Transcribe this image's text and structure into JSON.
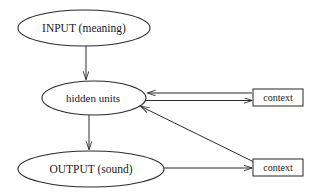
{
  "diagram": {
    "background_color": "#ffffff",
    "line_color": "#2b2b2b",
    "text_color": "#1a1a1a",
    "nodes": [
      {
        "id": "input",
        "label": "INPUT (meaning)",
        "shape": "ellipse",
        "cx": 84,
        "cy": 28,
        "rx": 66,
        "ry": 18
      },
      {
        "id": "hidden",
        "label": "hidden units",
        "shape": "ellipse",
        "cx": 94,
        "cy": 98,
        "rx": 52,
        "ry": 17
      },
      {
        "id": "output",
        "label": "OUTPUT (sound)",
        "shape": "ellipse",
        "cx": 91,
        "cy": 169,
        "rx": 73,
        "ry": 18
      },
      {
        "id": "context-upper",
        "label": "context",
        "shape": "rect",
        "x": 253,
        "y": 89,
        "width": 50,
        "height": 17
      },
      {
        "id": "context-lower",
        "label": "context",
        "shape": "rect",
        "x": 253,
        "y": 159,
        "width": 50,
        "height": 17
      }
    ],
    "edges": [
      {
        "id": "input-to-hidden",
        "from": "input",
        "to": "hidden",
        "direction": "down",
        "arrow": "end"
      },
      {
        "id": "hidden-to-output",
        "from": "hidden",
        "to": "output",
        "direction": "down",
        "arrow": "end"
      },
      {
        "id": "context-upper-to-hidden",
        "from": "context-upper",
        "to": "hidden",
        "direction": "left",
        "arrow": "end"
      },
      {
        "id": "hidden-to-context-upper",
        "from": "hidden",
        "to": "context-upper",
        "direction": "right",
        "arrow": "end"
      },
      {
        "id": "output-to-context-lower",
        "from": "output",
        "to": "context-lower",
        "direction": "right",
        "arrow": "end"
      },
      {
        "id": "context-lower-to-hidden",
        "from": "context-lower",
        "to": "hidden",
        "direction": "diagonal-up-left",
        "arrow": "end"
      }
    ]
  }
}
